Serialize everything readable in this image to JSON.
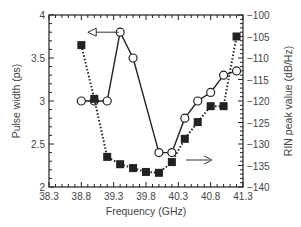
{
  "chart_data": {
    "type": "line",
    "title": "",
    "xlabel": "Frequency (GHz)",
    "ylabel": "Pulse width (ps)",
    "y2label": "RIN peak value (dB/Hz)",
    "xlim": [
      38.3,
      41.3
    ],
    "ylim": [
      2,
      4
    ],
    "y2lim": [
      -140,
      -100
    ],
    "grid": false,
    "x_ticks": [
      "38.3",
      "38.8",
      "39.3",
      "39.8",
      "40.3",
      "40.8",
      "41.3"
    ],
    "y_ticks": [
      "2",
      "2.5",
      "3",
      "3.5",
      "4"
    ],
    "y2_ticks": [
      "-140",
      "-135",
      "-130",
      "-125",
      "-120",
      "-115",
      "-110",
      "-105",
      "-100"
    ],
    "series": [
      {
        "name": "Pulse width",
        "axis": "left",
        "marker": "open-circle",
        "line": "solid",
        "x": [
          38.8,
          39.0,
          39.2,
          39.4,
          39.6,
          40.0,
          40.2,
          40.4,
          40.6,
          40.8,
          41.0,
          41.2
        ],
        "values": [
          3.0,
          3.0,
          3.0,
          3.8,
          3.5,
          2.4,
          2.4,
          2.8,
          3.0,
          3.1,
          3.3,
          3.35
        ]
      },
      {
        "name": "RIN peak value",
        "axis": "right",
        "marker": "filled-square",
        "line": "dotted",
        "x": [
          38.8,
          39.0,
          39.2,
          39.4,
          39.6,
          39.8,
          40.0,
          40.2,
          40.4,
          40.6,
          40.8,
          41.0,
          41.2
        ],
        "values": [
          -107,
          -119.5,
          -133,
          -134.7,
          -135.6,
          -136.5,
          -136.7,
          -134.2,
          -128.8,
          -124.9,
          -121.2,
          -121.2,
          -105
        ]
      }
    ],
    "annotations": [
      {
        "type": "arrow",
        "direction": "left",
        "points_to": "left axis (Pulse width)"
      },
      {
        "type": "arrow",
        "direction": "right",
        "points_to": "right axis (RIN peak value)"
      }
    ]
  }
}
